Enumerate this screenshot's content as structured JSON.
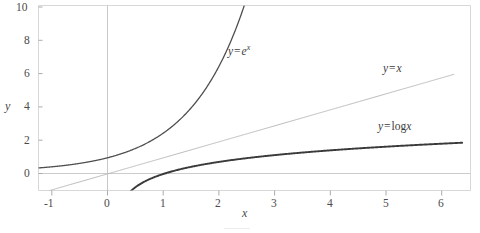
{
  "chart_data": {
    "type": "line",
    "title": "",
    "xlabel": "x",
    "ylabel": "y",
    "xlim": [
      -1.35,
      6.4
    ],
    "ylim": [
      -1.15,
      10.4
    ],
    "xticks": [
      "-1",
      "0",
      "1",
      "2",
      "3",
      "4",
      "5",
      "6"
    ],
    "xtick_values": [
      -1,
      0,
      1,
      2,
      3,
      4,
      5,
      6
    ],
    "yticks": [
      "0",
      "2",
      "4",
      "6",
      "8",
      "10"
    ],
    "ytick_values": [
      0,
      2,
      4,
      6,
      8,
      10
    ],
    "grid": false,
    "legend_position": "inline-annotations",
    "axis_lines": {
      "x_axis_at_y": 0,
      "y_axis_at_x": 0
    },
    "series": [
      {
        "name": "y = e^x",
        "label_text": "y = e",
        "label_sup": "x",
        "color": "#4f4f4f",
        "linewidth": 1.3,
        "x": [
          -1.35,
          -1.0,
          -0.5,
          0.0,
          0.5,
          1.0,
          1.25,
          1.5,
          1.75,
          2.0,
          2.15,
          2.3,
          2.34
        ],
        "values": [
          0.26,
          0.37,
          0.61,
          1.0,
          1.65,
          2.72,
          3.49,
          4.48,
          5.75,
          7.39,
          8.58,
          9.97,
          10.4
        ]
      },
      {
        "name": "y = x",
        "label_text": "y = x",
        "color": "#b4b4b4",
        "linewidth": 0.9,
        "x": [
          -1.15,
          0,
          2,
          4,
          6.1
        ],
        "values": [
          -1.15,
          0,
          2,
          4,
          6.1
        ]
      },
      {
        "name": "y = log x",
        "label_text": "y = log",
        "label_sup": "",
        "color": "#3a3a3a",
        "linewidth": 1.9,
        "x": [
          0.24,
          0.3,
          0.4,
          0.55,
          0.75,
          1.0,
          1.35,
          1.75,
          2.25,
          2.85,
          3.5,
          4.25,
          5.0,
          5.6,
          6.25
        ],
        "values": [
          -1.43,
          -1.2,
          -0.92,
          -0.6,
          -0.29,
          0.0,
          0.3,
          0.56,
          0.81,
          1.05,
          1.25,
          1.45,
          1.61,
          1.72,
          1.83
        ]
      }
    ],
    "annotations": [
      {
        "id": "exp-label",
        "text_prefix": "y",
        "text_op": "=",
        "text_body": "e",
        "text_sup": "x",
        "x_px": 228,
        "y_px": 49
      },
      {
        "id": "linear-label",
        "text_prefix": "y",
        "text_op": "=",
        "text_body": "x",
        "text_sup": "",
        "x_px": 383,
        "y_px": 68
      },
      {
        "id": "log-label",
        "text_prefix": "y",
        "text_op": "=",
        "text_body": "log",
        "text_sup": "x",
        "x_px": 378,
        "y_px": 126
      }
    ]
  },
  "axes": {
    "y_axis_title": "y",
    "x_axis_title": "x"
  },
  "caption": {
    "text": ""
  }
}
